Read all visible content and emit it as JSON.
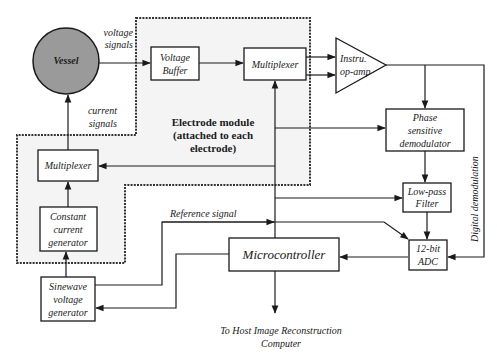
{
  "diagram": {
    "vessel": "Vessel",
    "voltage_signals": [
      "voltage",
      "signals"
    ],
    "current_signals": [
      "current",
      "signals"
    ],
    "voltage_buffer": [
      "Voltage",
      "Buffer"
    ],
    "multiplexer_top": "Multiplexer",
    "instru_opamp": [
      "Instru.",
      "op-amp"
    ],
    "electrode_module": [
      "Electrode module",
      "(attached to each",
      "electrode)"
    ],
    "phase_demod": [
      "Phase",
      "sensitive",
      "demodulator"
    ],
    "multiplexer_left": "Multiplexer",
    "constant_current": [
      "Constant",
      "current",
      "generator"
    ],
    "low_pass": [
      "Low-pass",
      "Filter"
    ],
    "reference_signal": "Reference signal",
    "adc": [
      "12-bit",
      "ADC"
    ],
    "microcontroller": "Microcontroller",
    "sinewave": [
      "Sinewave",
      "voltage",
      "generator"
    ],
    "digital_demod": "Digital demodulation",
    "host": [
      "To Host Image  Reconstruction",
      "Computer"
    ]
  },
  "colors": {
    "ink": "#1a1a1a",
    "vessel_fill": "#9a9a9a",
    "module_bg": "#f4f4f4"
  }
}
